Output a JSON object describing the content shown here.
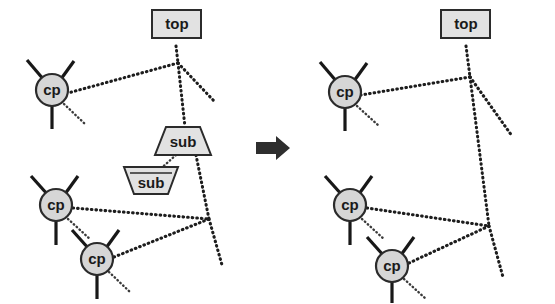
{
  "figure": {
    "type": "diagram",
    "background_color": "#ffffff",
    "ink_color": "#1a1a1a",
    "node_fill_color": "#d6d6d6",
    "box_fill_color": "#e2e2e2",
    "arrow_color": "#2e2e2e"
  },
  "transform_arrow": {
    "name": "rewrites-to",
    "glyph": "right-arrow",
    "x": 258,
    "y": 148
  },
  "panels": [
    {
      "id": "lhs",
      "name": "left-hand-side",
      "nodes": [
        {
          "id": "lhs-top",
          "label": "top",
          "shape": "rectangle",
          "x": 178,
          "y": 28
        },
        {
          "id": "lhs-sub1",
          "label": "sub",
          "shape": "trapezoid",
          "x": 182,
          "y": 140
        },
        {
          "id": "lhs-sub2",
          "label": "sub",
          "shape": "inverted-trapezoid",
          "x": 150,
          "y": 180
        },
        {
          "id": "lhs-cp1",
          "label": "cp",
          "shape": "circle",
          "x": 52,
          "y": 90
        },
        {
          "id": "lhs-cp2",
          "label": "cp",
          "shape": "circle",
          "x": 56,
          "y": 205
        },
        {
          "id": "lhs-cp3",
          "label": "cp",
          "shape": "circle",
          "x": 97,
          "y": 259
        }
      ],
      "junctions": [
        {
          "id": "lhs-j1",
          "x": 178,
          "y": 63
        },
        {
          "id": "lhs-j2",
          "x": 209,
          "y": 219
        }
      ]
    },
    {
      "id": "rhs",
      "name": "right-hand-side",
      "nodes": [
        {
          "id": "rhs-top",
          "label": "top",
          "shape": "rectangle",
          "x": 466,
          "y": 28
        },
        {
          "id": "rhs-cp1",
          "label": "cp",
          "shape": "circle",
          "x": 345,
          "y": 92
        },
        {
          "id": "rhs-cp2",
          "label": "cp",
          "shape": "circle",
          "x": 350,
          "y": 205
        },
        {
          "id": "rhs-cp3",
          "label": "cp",
          "shape": "circle",
          "x": 392,
          "y": 266
        }
      ],
      "junctions": [
        {
          "id": "rhs-j1",
          "x": 470,
          "y": 77
        },
        {
          "id": "rhs-j2",
          "x": 489,
          "y": 226
        }
      ]
    }
  ],
  "legend_semantics": {
    "solid_line": "port / terminal connection",
    "dotted_line": "link relation",
    "arrowhead": "directed incoming port"
  }
}
